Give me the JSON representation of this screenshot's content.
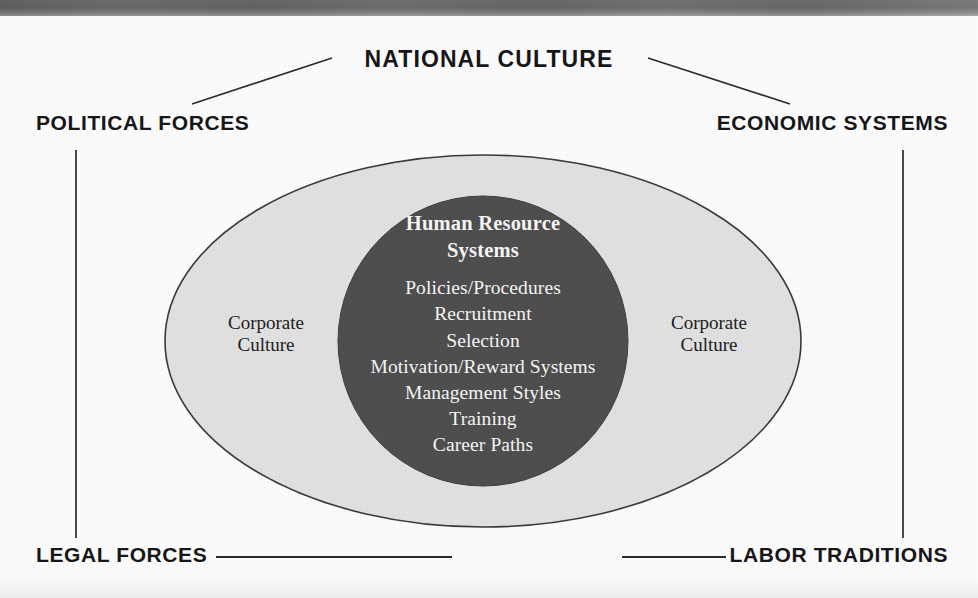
{
  "figure": {
    "kind": "concentric-ellipse-framework-diagram",
    "top_banner": {
      "present": true,
      "color": "#636363"
    },
    "canvas": {
      "width": 978,
      "height": 598,
      "background": "#fdfdfd"
    }
  },
  "frame": {
    "top_label": "NATIONAL CULTURE",
    "top_left_label": "POLITICAL FORCES",
    "top_right_label": "ECONOMIC SYSTEMS",
    "bottom_left_label": "LEGAL FORCES",
    "bottom_right_label": "LABOR TRADITIONS",
    "connector_color": "#2b2b2b"
  },
  "outer_ellipse": {
    "label_left": "Corporate\nCulture",
    "label_left_line1": "Corporate",
    "label_left_line2": "Culture",
    "label_right_line1": "Corporate",
    "label_right_line2": "Culture",
    "fill": "#e2e2e2",
    "stroke": "#3b3b3b",
    "cx": 483,
    "cy": 341,
    "rx": 318,
    "ry": 186
  },
  "inner_circle": {
    "title_line1": "Human Resource",
    "title_line2": "Systems",
    "items": [
      "Policies/Procedures",
      "Recruitment",
      "Selection",
      "Motivation/Reward Systems",
      "Management Styles",
      "Training",
      "Career Paths"
    ],
    "fill": "#4f4f4f",
    "text_color": "#f7f7f7",
    "cx": 483,
    "cy": 341,
    "r": 145
  },
  "chart_data": {
    "type": "table",
    "levels": [
      {
        "level": 1,
        "name": "National Culture",
        "members": [
          "POLITICAL FORCES",
          "ECONOMIC SYSTEMS",
          "LEGAL FORCES",
          "LABOR TRADITIONS"
        ]
      },
      {
        "level": 2,
        "name": "Corporate Culture",
        "members": [
          "Corporate Culture"
        ]
      },
      {
        "level": 3,
        "name": "Human Resource Systems",
        "members": [
          "Policies/Procedures",
          "Recruitment",
          "Selection",
          "Motivation/Reward Systems",
          "Management Styles",
          "Training",
          "Career Paths"
        ]
      }
    ]
  }
}
